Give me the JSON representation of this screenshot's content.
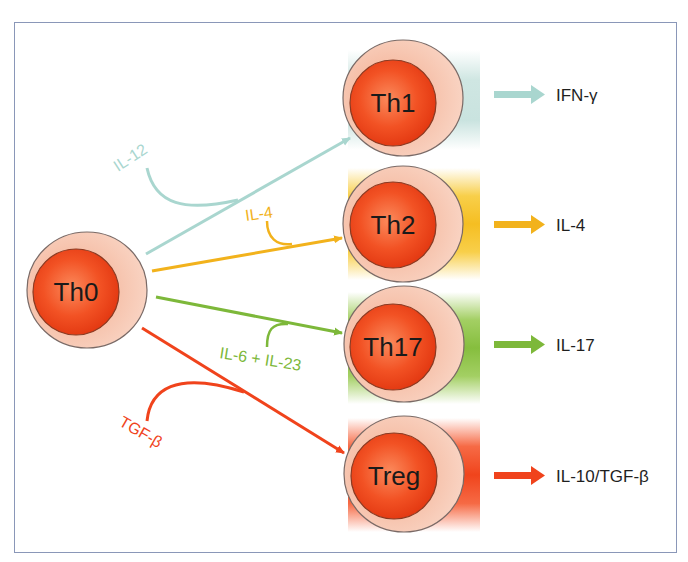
{
  "diagram": {
    "source_cell": {
      "label": "Th0"
    },
    "pathways": [
      {
        "id": "th1",
        "cell": "Th1",
        "inducer": "IL-12",
        "product": "IFN-γ",
        "color": "#a9d6cf"
      },
      {
        "id": "th2",
        "cell": "Th2",
        "inducer": "IL-4",
        "product": "IL-4",
        "color": "#f2b21c"
      },
      {
        "id": "th17",
        "cell": "Th17",
        "inducer": "IL-6 + IL-23",
        "product": "IL-17",
        "color": "#7db83a"
      },
      {
        "id": "treg",
        "cell": "Treg",
        "inducer": "TGF-β",
        "product": "IL-10/TGF-β",
        "color": "#f0431c"
      }
    ],
    "colors": {
      "frame": "#8a97b8",
      "cell_outer": "#f6c2ad",
      "cell_nucleus": "#f0441c",
      "cell_outline": "#7a5a50"
    }
  }
}
